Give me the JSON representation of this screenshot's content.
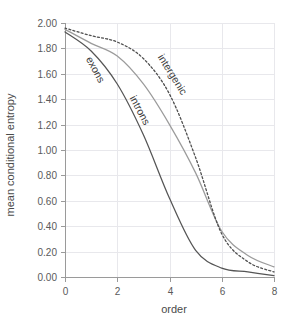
{
  "chart_data": {
    "type": "line",
    "title": "",
    "xlabel": "order",
    "ylabel": "mean conditional entropy",
    "xlim": [
      0,
      8
    ],
    "ylim": [
      0.0,
      2.0
    ],
    "grid": true,
    "legend_position": "inline-curve-labels",
    "x": [
      0,
      1,
      2,
      3,
      4,
      5,
      6,
      7,
      8
    ],
    "xticks": [
      "0",
      "2",
      "4",
      "6",
      "8"
    ],
    "xtick_values": [
      0,
      2,
      4,
      6,
      8
    ],
    "yticks": [
      "0.00",
      "0.20",
      "0.40",
      "0.60",
      "0.80",
      "1.00",
      "1.20",
      "1.40",
      "1.60",
      "1.80",
      "2.00"
    ],
    "ytick_values": [
      0.0,
      0.2,
      0.4,
      0.6,
      0.8,
      1.0,
      1.2,
      1.4,
      1.6,
      1.8,
      2.0
    ],
    "series": [
      {
        "name": "exons",
        "style": "solid",
        "color": "#555555",
        "values": [
          1.93,
          1.78,
          1.52,
          1.12,
          0.62,
          0.21,
          0.07,
          0.04,
          0.01
        ]
      },
      {
        "name": "introns",
        "style": "solid",
        "color": "#9b9b9b",
        "values": [
          1.95,
          1.84,
          1.74,
          1.52,
          1.2,
          0.82,
          0.36,
          0.17,
          0.08
        ]
      },
      {
        "name": "intergenic",
        "style": "dotted",
        "color": "#4f4f4f",
        "values": [
          1.96,
          1.9,
          1.85,
          1.72,
          1.44,
          0.94,
          0.34,
          0.12,
          0.04
        ]
      }
    ],
    "annotations": [
      {
        "text": "exons",
        "x": 1.05,
        "y": 1.62,
        "rotation": 62
      },
      {
        "text": "introns",
        "x": 2.75,
        "y": 1.3,
        "rotation": 62
      },
      {
        "text": "intergenic",
        "x": 4.0,
        "y": 1.58,
        "rotation": 58
      }
    ]
  },
  "colors": {
    "background": "#ffffff",
    "grid": "#e8e8ec",
    "axis": "#9a9a9a",
    "text": "#4a4a4a",
    "exons": "#555555",
    "introns": "#9b9b9b",
    "intergenic": "#4f4f4f"
  }
}
